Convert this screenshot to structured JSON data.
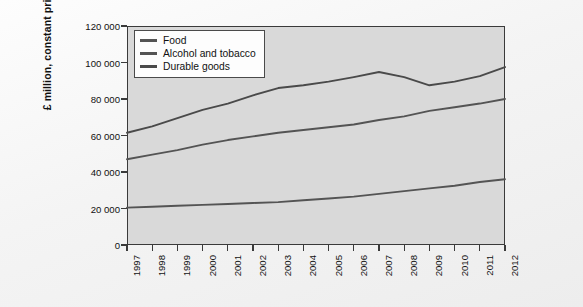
{
  "background": {
    "ghost_text_1": "Causes of changes in industrial structure",
    "ghost_text_2": "spending patterns",
    "ghost_text_3": "changing consumer demand",
    "ghost_text_4": "services and manufacturing"
  },
  "colors": {
    "plot_background": "#d9d9d9",
    "axis": "#3a3a3a",
    "food_line": "#545454",
    "alcohol_line": "#545454",
    "durable_line": "#4a4a4a",
    "page_background": "#f4f4f4"
  },
  "chart_data": {
    "type": "line",
    "title": "",
    "xlabel": "",
    "ylabel": "£ million, constant prices",
    "x": [
      "1997",
      "1998",
      "1999",
      "2000",
      "2001",
      "2002",
      "2003",
      "2004",
      "2005",
      "2006",
      "2007",
      "2008",
      "2009",
      "2010",
      "2011",
      "2012"
    ],
    "xlim": [
      1997,
      2012
    ],
    "ylim": [
      0,
      120000
    ],
    "yticks": [
      0,
      20000,
      40000,
      60000,
      80000,
      100000,
      120000
    ],
    "ytick_labels": [
      "0",
      "20 000",
      "40 000",
      "60 000",
      "80 000",
      "100 000",
      "120 000"
    ],
    "grid": false,
    "legend_position": "top-left",
    "series": [
      {
        "name": "Food",
        "color": "#545454",
        "values": [
          47000,
          49500,
          52000,
          55000,
          57500,
          59500,
          61500,
          63000,
          64500,
          66000,
          68500,
          70500,
          73500,
          75500,
          77500,
          80000
        ]
      },
      {
        "name": "Alcohol and tobacco",
        "color": "#545454",
        "values": [
          20500,
          21000,
          21500,
          22000,
          22500,
          23000,
          23500,
          24500,
          25500,
          26500,
          28000,
          29500,
          31000,
          32500,
          34500,
          36000
        ]
      },
      {
        "name": "Durable goods",
        "color": "#4a4a4a",
        "values": [
          61500,
          65000,
          69500,
          74000,
          77500,
          82000,
          86000,
          87500,
          89500,
          92000,
          94800,
          92000,
          87500,
          89500,
          92500,
          97500
        ]
      }
    ]
  },
  "legend": {
    "items": [
      {
        "label": "Food"
      },
      {
        "label": "Alcohol and tobacco"
      },
      {
        "label": "Durable goods"
      }
    ]
  }
}
